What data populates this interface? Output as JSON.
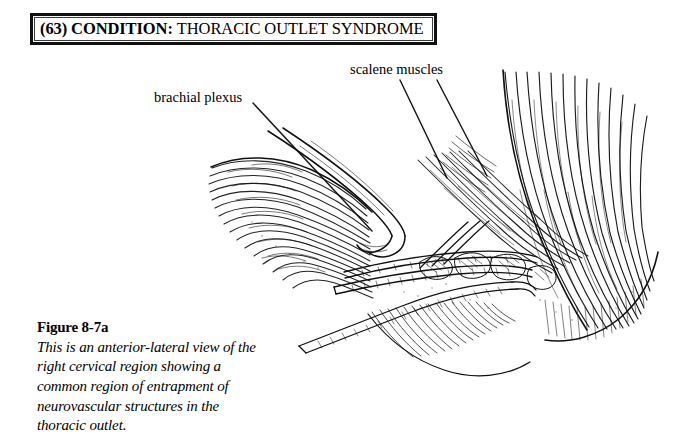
{
  "page": {
    "background_color": "#ffffff",
    "ink_color": "#000000"
  },
  "header": {
    "number_and_keyword": "(63) CONDITION:",
    "condition_name": "THORACIC OUTLET SYNDROME",
    "border_color": "#101010"
  },
  "annotations": [
    {
      "id": "brachial-plexus",
      "label": "brachial plexus",
      "leader_lines": [
        {
          "x1": 253,
          "y1": 103,
          "x2": 372,
          "y2": 231
        }
      ]
    },
    {
      "id": "scalene-muscles",
      "label": "scalene muscles",
      "leader_lines": [
        {
          "x1": 400,
          "y1": 80,
          "x2": 447,
          "y2": 178
        },
        {
          "x1": 437,
          "y1": 80,
          "x2": 487,
          "y2": 176
        }
      ]
    }
  ],
  "caption": {
    "title": "Figure 8-7a",
    "body": "This is an anterior-lateral view of the right cervical region showing a common region of entrapment of neurovascular structures in the thoracic outlet."
  },
  "illustration": {
    "name": "anterior-lateral-right-cervical-region-drawing",
    "style": "pen-and-ink line hatching",
    "bounds": {
      "x": 205,
      "y": 70,
      "width": 460,
      "height": 300
    }
  }
}
